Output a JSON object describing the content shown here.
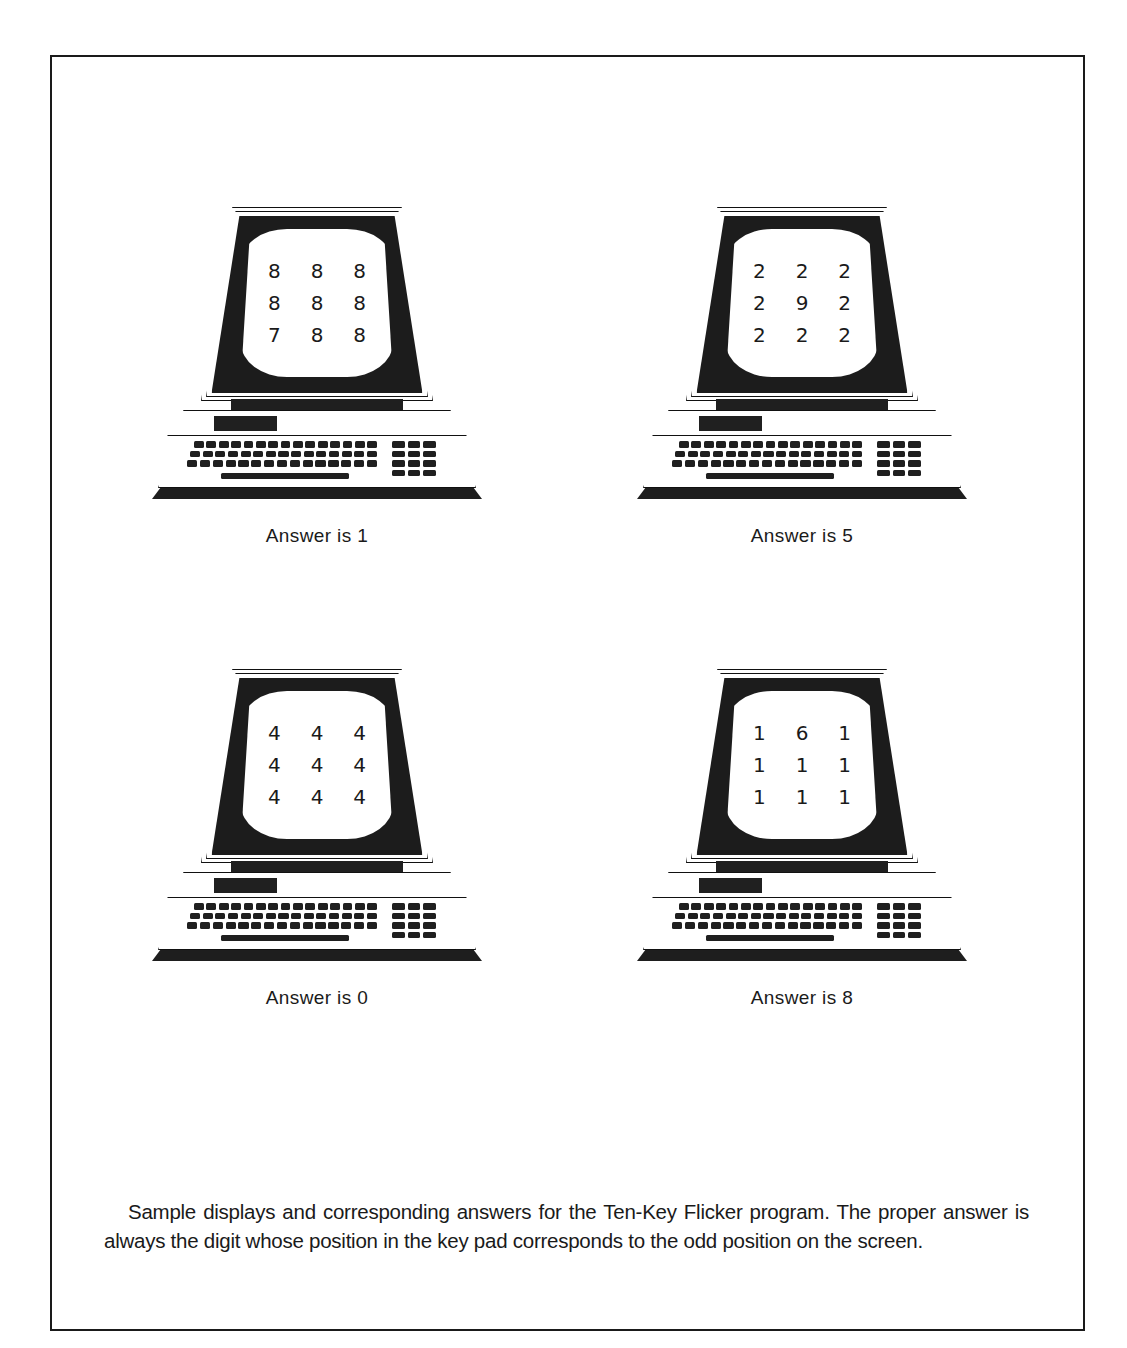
{
  "figure": {
    "caption": "Sample displays and corresponding answers for the Ten-Key Flicker program. The proper answer is always the digit whose position in the key pad corresponds to the odd position on the screen.",
    "frame_color": "#1a1a1a",
    "background_color": "#ffffff",
    "ink_color": "#1f1f1f"
  },
  "units": [
    {
      "id": "unit-1",
      "position": "top-left",
      "screen_rows": [
        [
          "8",
          "8",
          "8"
        ],
        [
          "8",
          "8",
          "8"
        ],
        [
          "7",
          "8",
          "8"
        ]
      ],
      "odd_digit": "7",
      "odd_row": 3,
      "odd_col": 1,
      "answer_label": "Answer is 1",
      "answer_value": "1"
    },
    {
      "id": "unit-2",
      "position": "top-right",
      "screen_rows": [
        [
          "2",
          "2",
          "2"
        ],
        [
          "2",
          "9",
          "2"
        ],
        [
          "2",
          "2",
          "2"
        ]
      ],
      "odd_digit": "9",
      "odd_row": 2,
      "odd_col": 2,
      "answer_label": "Answer is 5",
      "answer_value": "5"
    },
    {
      "id": "unit-3",
      "position": "bottom-left",
      "screen_rows": [
        [
          "4",
          "4",
          "4"
        ],
        [
          "4",
          "4",
          "4"
        ],
        [
          "4",
          "4",
          "4"
        ]
      ],
      "odd_digit": "",
      "odd_row": 0,
      "odd_col": 0,
      "answer_label": "Answer is 0",
      "answer_value": "0"
    },
    {
      "id": "unit-4",
      "position": "bottom-right",
      "screen_rows": [
        [
          "1",
          "6",
          "1"
        ],
        [
          "1",
          "1",
          "1"
        ],
        [
          "1",
          "1",
          "1"
        ]
      ],
      "odd_digit": "6",
      "odd_row": 1,
      "odd_col": 2,
      "answer_label": "Answer is 8",
      "answer_value": "8"
    }
  ],
  "hardware": {
    "keyboard_main_rows": [
      15,
      15,
      15
    ],
    "keyboard_pad_rows": [
      3,
      3,
      3,
      3
    ],
    "has_spacebar": true,
    "has_badge": true
  }
}
